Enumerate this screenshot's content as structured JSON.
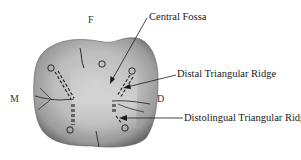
{
  "diagram": {
    "type": "dental-occlusal-view",
    "orientation_labels": {
      "top": "F",
      "left": "M",
      "right": "D"
    },
    "annotations": [
      {
        "id": "central-fossa",
        "label": "Central Fossa"
      },
      {
        "id": "distal-triangular-ridge",
        "label": "Distal Triangular Ridge"
      },
      {
        "id": "distolingual-triangular-ridge",
        "label": "Distolingual Triangular Ridge"
      }
    ],
    "colors": {
      "background": "#ffffff",
      "tooth_light": "#c9c9c9",
      "tooth_mid": "#a8a8a8",
      "tooth_dark": "#6e6e6e",
      "lines": "#1a1a1a"
    }
  }
}
